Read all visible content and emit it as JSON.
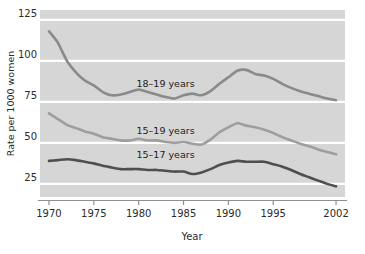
{
  "chart_data": {
    "type": "line",
    "title": "",
    "xlabel": "Year",
    "ylabel": "Rate per 1000 women",
    "xlim": [
      1969,
      2003
    ],
    "ylim": [
      17,
      131
    ],
    "xticks": [
      "1970",
      "1975",
      "1980",
      "1985",
      "1990",
      "1995",
      "2002"
    ],
    "xtick_values": [
      1970,
      1975,
      1980,
      1985,
      1990,
      1995,
      2002
    ],
    "yticks": [
      "25",
      "50",
      "75",
      "100",
      "125"
    ],
    "ytick_values": [
      25,
      50,
      75,
      100,
      125
    ],
    "grid": "horizontal-white-gridlines",
    "legend": "inline-series-labels",
    "plot_background": "#d6d6d6",
    "gridline_color": "#ffffff",
    "x": [
      1970,
      1971,
      1972,
      1973,
      1974,
      1975,
      1976,
      1977,
      1978,
      1979,
      1980,
      1981,
      1982,
      1983,
      1984,
      1985,
      1986,
      1987,
      1988,
      1989,
      1990,
      1991,
      1992,
      1993,
      1994,
      1995,
      1996,
      1997,
      1998,
      1999,
      2000,
      2001,
      2002
    ],
    "series": [
      {
        "name": "18–19 years",
        "color": "#8a8a8a",
        "label_x": 1983.0,
        "label_y": 84.0,
        "values": [
          118.0,
          111.0,
          100.0,
          93.0,
          88.0,
          85.0,
          81.0,
          79.0,
          79.5,
          81.0,
          82.5,
          81.0,
          79.5,
          78.0,
          77.0,
          79.0,
          80.0,
          79.0,
          81.5,
          86.0,
          90.0,
          94.0,
          94.5,
          92.0,
          91.0,
          89.0,
          86.0,
          83.5,
          81.5,
          80.0,
          78.5,
          77.0,
          76.0
        ]
      },
      {
        "name": "15–19 years",
        "color": "#9e9e9e",
        "label_x": 1983.0,
        "label_y": 55.5,
        "values": [
          68.0,
          64.5,
          61.0,
          59.0,
          57.0,
          55.5,
          53.5,
          52.5,
          51.5,
          51.5,
          52.5,
          51.5,
          51.5,
          50.5,
          50.0,
          50.5,
          49.5,
          49.0,
          52.0,
          56.5,
          59.5,
          62.0,
          60.5,
          59.5,
          58.0,
          56.0,
          53.5,
          51.5,
          49.5,
          48.0,
          46.0,
          44.5,
          43.0
        ]
      },
      {
        "name": "15–17 years",
        "color": "#4f4f4f",
        "label_x": 1983.0,
        "label_y": 41.0,
        "values": [
          39.0,
          39.5,
          40.0,
          39.5,
          38.5,
          37.5,
          36.0,
          35.0,
          34.0,
          34.0,
          34.0,
          33.5,
          33.5,
          33.0,
          32.5,
          32.5,
          31.0,
          32.0,
          34.0,
          36.5,
          38.0,
          39.0,
          38.5,
          38.5,
          38.5,
          37.0,
          35.5,
          33.5,
          31.0,
          29.0,
          27.0,
          25.0,
          23.5
        ]
      }
    ]
  }
}
